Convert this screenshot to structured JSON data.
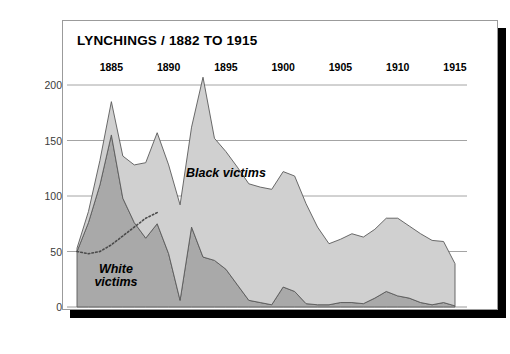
{
  "card": {
    "title": "LYNCHINGS / 1882 TO 1915"
  },
  "colors": {
    "card_background": "#ffffff",
    "card_border": "#9b9b9b",
    "shadow": "#000000",
    "white_victims_fill": "#a9a9a9",
    "black_victims_fill": "#d0d0d0",
    "series_stroke": "#5a5a5a",
    "gridline": "#8d8d8d",
    "text": "#000000",
    "ytick_text": "#3a3a3a"
  },
  "chart_data": {
    "type": "area",
    "title": "LYNCHINGS / 1882 TO 1915",
    "xlabel": "",
    "ylabel": "",
    "stacked": true,
    "grid": true,
    "legend_position": "inline-annotation",
    "xlim": [
      1882,
      1915
    ],
    "ylim": [
      0,
      200
    ],
    "yticks": [
      0,
      50,
      100,
      150,
      200
    ],
    "ytick_labels": [
      "0",
      "50",
      "100",
      "150",
      "200"
    ],
    "xticks": [
      1885,
      1890,
      1895,
      1900,
      1905,
      1910,
      1915
    ],
    "xtick_labels": [
      "1885",
      "1890",
      "1895",
      "1900",
      "1905",
      "1910",
      "1915"
    ],
    "x": [
      1882,
      1883,
      1884,
      1885,
      1886,
      1887,
      1888,
      1889,
      1890,
      1891,
      1892,
      1893,
      1894,
      1895,
      1896,
      1897,
      1898,
      1899,
      1900,
      1901,
      1902,
      1903,
      1904,
      1905,
      1906,
      1907,
      1908,
      1909,
      1910,
      1911,
      1912,
      1913,
      1914,
      1915
    ],
    "series": [
      {
        "name": "White victims",
        "fill": "#a9a9a9",
        "values": [
          50,
          76,
          110,
          155,
          98,
          76,
          62,
          75,
          48,
          6,
          72,
          45,
          42,
          34,
          20,
          6,
          4,
          2,
          18,
          14,
          3,
          2,
          2,
          4,
          4,
          3,
          8,
          14,
          10,
          8,
          4,
          2,
          4,
          1
        ]
      },
      {
        "name": "Black victims",
        "fill": "#d0d0d0",
        "values": [
          3,
          10,
          22,
          30,
          38,
          52,
          68,
          82,
          80,
          86,
          90,
          162,
          110,
          106,
          106,
          105,
          104,
          104,
          104,
          104,
          90,
          70,
          55,
          57,
          62,
          60,
          62,
          66,
          70,
          65,
          62,
          58,
          55,
          38
        ]
      }
    ],
    "annotations": [
      {
        "text": "White victims",
        "lines": [
          "White",
          "victims"
        ],
        "x": 1885.4,
        "y": 28,
        "style": "bold-italic"
      },
      {
        "text": "Black victims",
        "lines": [
          "Black victims"
        ],
        "x": 1895.0,
        "y": 120,
        "style": "bold-italic"
      }
    ],
    "overlay_line": {
      "name": "white-victims-trend",
      "style": "dotted",
      "color": "#4a4a4a",
      "x": [
        1882,
        1883,
        1884,
        1885,
        1886,
        1887,
        1888,
        1889
      ],
      "y": [
        50,
        48,
        50,
        56,
        64,
        72,
        80,
        85
      ]
    }
  }
}
